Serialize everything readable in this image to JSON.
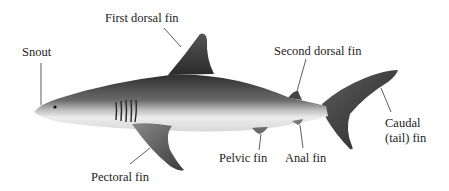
{
  "diagram": {
    "labels": {
      "snout": "Snout",
      "first_dorsal_fin": "First dorsal fin",
      "second_dorsal_fin": "Second dorsal fin",
      "caudal_line1": "Caudal",
      "caudal_line2": "(tail) fin",
      "pectoral_fin": "Pectoral fin",
      "pelvic_fin": "Pelvic fin",
      "anal_fin": "Anal fin"
    },
    "colors": {
      "body_dark": "#3a3a3a",
      "body_mid": "#6e6e6e",
      "belly": "#e6e6e6",
      "leader_line": "#333333",
      "text": "#222222"
    }
  }
}
